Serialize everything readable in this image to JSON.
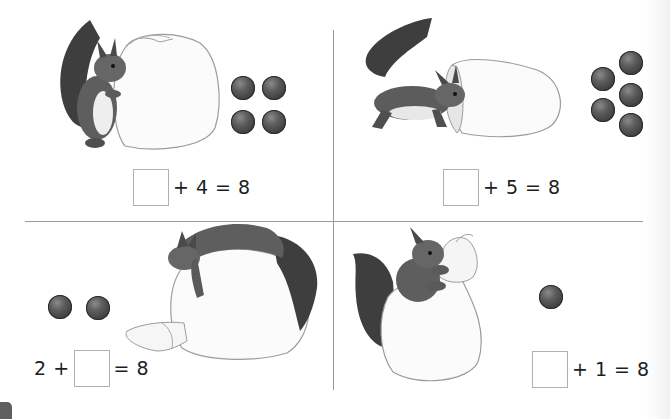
{
  "page": {
    "type": "math-worksheet",
    "layout": "2x2 grid of exercises"
  },
  "colors": {
    "divider": "#9a9a9a",
    "ball": "#4a4a4a",
    "answer_box_border": "#b0b0b0",
    "text": "#1e1e1e"
  },
  "panels": [
    {
      "id": "top-left",
      "illustration": "squirrel standing beside a closed sack",
      "ball_count": 4,
      "equation": {
        "before": "",
        "after": "+ 4 = 8",
        "answer": ""
      }
    },
    {
      "id": "top-right",
      "illustration": "squirrel peeking into an open sack",
      "ball_count": 5,
      "equation": {
        "before": "",
        "after": "+ 5 = 8",
        "answer": ""
      }
    },
    {
      "id": "bottom-left",
      "illustration": "squirrel lying on top of a tied sack",
      "ball_count": 2,
      "equation": {
        "before": "2 +",
        "after": "= 8",
        "answer": ""
      }
    },
    {
      "id": "bottom-right",
      "illustration": "squirrel holding a tied sack",
      "ball_count": 1,
      "equation": {
        "before": "",
        "after": "+ 1 = 8",
        "answer": ""
      }
    }
  ]
}
